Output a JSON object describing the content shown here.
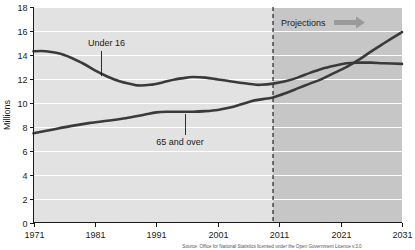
{
  "chart_data": {
    "type": "line",
    "title": "",
    "xlabel": "",
    "ylabel": "Millions",
    "xlim": [
      1971,
      2031
    ],
    "ylim": [
      0,
      18
    ],
    "grid": true,
    "legend_position": "inline-annotations",
    "x_ticks": [
      "1971",
      "1981",
      "1991",
      "2001",
      "2011",
      "2021",
      "2031"
    ],
    "y_ticks": [
      "0",
      "2",
      "4",
      "6",
      "8",
      "10",
      "12",
      "14",
      "16",
      "18"
    ],
    "annotations": [
      {
        "text": "Projections",
        "kind": "region-label"
      },
      {
        "text": "Under 16",
        "kind": "series-callout"
      },
      {
        "text": "65 and over",
        "kind": "series-callout"
      }
    ],
    "projection_start_year": 2010,
    "series": [
      {
        "name": "Under 16",
        "color": "#3a3a3a",
        "x": [
          1971,
          1973,
          1976,
          1979,
          1981,
          1983,
          1985,
          1987,
          1988,
          1990,
          1992,
          1994,
          1996,
          1997,
          1999,
          2001,
          2003,
          2005,
          2007,
          2008,
          2010,
          2012,
          2014,
          2016,
          2018,
          2020,
          2022,
          2024,
          2026,
          2028,
          2031
        ],
        "values": [
          14.3,
          14.3,
          14.0,
          13.3,
          12.7,
          12.2,
          11.8,
          11.55,
          11.45,
          11.5,
          11.7,
          11.95,
          12.1,
          12.15,
          12.1,
          11.95,
          11.8,
          11.65,
          11.52,
          11.5,
          11.6,
          11.8,
          12.1,
          12.5,
          12.85,
          13.1,
          13.3,
          13.35,
          13.35,
          13.3,
          13.25
        ]
      },
      {
        "name": "65 and over",
        "color": "#3a3a3a",
        "x": [
          1971,
          1974,
          1977,
          1980,
          1983,
          1986,
          1989,
          1991,
          1993,
          1995,
          1997,
          1999,
          2001,
          2003,
          2005,
          2007,
          2009,
          2010,
          2012,
          2014,
          2016,
          2018,
          2020,
          2022,
          2024,
          2026,
          2028,
          2031
        ],
        "values": [
          7.45,
          7.75,
          8.05,
          8.3,
          8.5,
          8.7,
          9.0,
          9.2,
          9.25,
          9.25,
          9.25,
          9.3,
          9.4,
          9.6,
          9.9,
          10.2,
          10.35,
          10.45,
          10.8,
          11.2,
          11.6,
          12.0,
          12.5,
          13.0,
          13.6,
          14.3,
          14.95,
          15.9
        ]
      }
    ],
    "source_note": "Source: Office for National Statistics licensed under the Open Government Licence v.3.0"
  },
  "colors": {
    "plot_background_historical": "#e2e2e2",
    "plot_background_projection": "#c6c6c6",
    "gridline": "#ffffff",
    "line": "#3a3a3a",
    "axis": "#1a1a1a",
    "arrow": "#9a9a9a",
    "page_background": "#ffffff"
  }
}
